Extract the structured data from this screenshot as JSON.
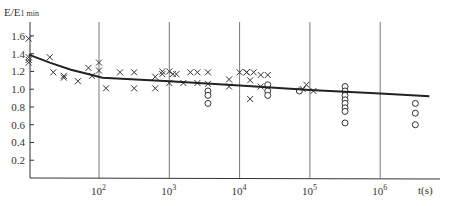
{
  "chart_data": {
    "type": "scatter",
    "title": "",
    "ylabel": "E/E1 min",
    "xlabel": "t(s)",
    "xscale": "log",
    "xlim_log10": [
      1.0,
      6.7
    ],
    "ylim": [
      0,
      1.7
    ],
    "y_ticks": [
      "0.2",
      "0.4",
      "0.6",
      "0.8",
      "1.0",
      "1.2",
      "1.4",
      "1.6"
    ],
    "x_ticks": [
      {
        "label": "10",
        "exp": "2",
        "log": 2
      },
      {
        "label": "10",
        "exp": "3",
        "log": 3
      },
      {
        "label": "10",
        "exp": "4",
        "log": 4
      },
      {
        "label": "10",
        "exp": "5",
        "log": 5
      },
      {
        "label": "10",
        "exp": "6",
        "log": 6
      }
    ],
    "grid": "vertical lines at decades",
    "series": [
      {
        "name": "crosses",
        "marker": "x",
        "points": [
          [
            1.0,
            1.57
          ],
          [
            1.0,
            1.36
          ],
          [
            1.0,
            1.33
          ],
          [
            1.0,
            1.3
          ],
          [
            1.3,
            1.36
          ],
          [
            1.35,
            1.19
          ],
          [
            1.5,
            1.15
          ],
          [
            1.5,
            1.13
          ],
          [
            1.7,
            1.09
          ],
          [
            1.85,
            1.24
          ],
          [
            1.9,
            1.15
          ],
          [
            2.0,
            1.3
          ],
          [
            2.0,
            1.21
          ],
          [
            2.1,
            1.01
          ],
          [
            2.3,
            1.19
          ],
          [
            2.5,
            1.19
          ],
          [
            2.5,
            1.01
          ],
          [
            2.8,
            1.14
          ],
          [
            2.8,
            1.01
          ],
          [
            2.9,
            1.17
          ],
          [
            2.9,
            1.2
          ],
          [
            3.0,
            1.2
          ],
          [
            3.05,
            1.17
          ],
          [
            3.0,
            1.07
          ],
          [
            3.1,
            1.17
          ],
          [
            3.2,
            1.07
          ],
          [
            3.3,
            1.19
          ],
          [
            3.4,
            1.19
          ],
          [
            3.4,
            1.07
          ],
          [
            3.55,
            1.19
          ],
          [
            3.55,
            1.06
          ],
          [
            3.85,
            1.11
          ],
          [
            3.85,
            1.03
          ],
          [
            4.0,
            1.19
          ],
          [
            4.1,
            1.19
          ],
          [
            4.1,
            1.19
          ],
          [
            4.2,
            1.19
          ],
          [
            4.15,
            1.1
          ],
          [
            4.15,
            0.89
          ],
          [
            4.3,
            1.16
          ],
          [
            4.4,
            1.16
          ],
          [
            4.3,
            1.03
          ],
          [
            4.9,
            1.0
          ],
          [
            4.95,
            1.05
          ],
          [
            5.05,
            0.98
          ]
        ]
      },
      {
        "name": "circles",
        "marker": "o",
        "points": [
          [
            3.55,
            0.98
          ],
          [
            3.55,
            0.93
          ],
          [
            3.55,
            0.84
          ],
          [
            4.4,
            1.05
          ],
          [
            4.4,
            0.98
          ],
          [
            4.4,
            0.93
          ],
          [
            4.85,
            0.98
          ],
          [
            5.5,
            1.03
          ],
          [
            5.5,
            0.98
          ],
          [
            5.5,
            0.93
          ],
          [
            5.5,
            0.88
          ],
          [
            5.5,
            0.84
          ],
          [
            5.5,
            0.79
          ],
          [
            5.5,
            0.75
          ],
          [
            5.5,
            0.62
          ],
          [
            6.5,
            0.84
          ],
          [
            6.5,
            0.73
          ],
          [
            6.5,
            0.6
          ]
        ]
      },
      {
        "name": "fit curve",
        "marker": "line",
        "points": [
          [
            1.0,
            1.39
          ],
          [
            1.3,
            1.3
          ],
          [
            1.6,
            1.22
          ],
          [
            1.9,
            1.16
          ],
          [
            2.05,
            1.13
          ],
          [
            3.0,
            1.09
          ],
          [
            4.0,
            1.04
          ],
          [
            5.0,
            0.99
          ],
          [
            6.0,
            0.95
          ],
          [
            6.7,
            0.92
          ]
        ]
      }
    ]
  }
}
